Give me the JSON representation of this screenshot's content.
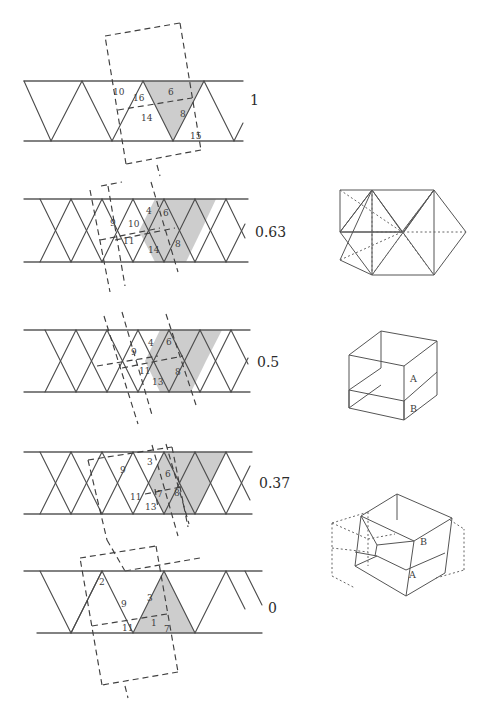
{
  "figure": {
    "background_color": "#ffffff",
    "shade_color": "#c4c4c4",
    "line_color": "#4a4a4a",
    "dash_color": "#3f3f3f"
  },
  "panels": [
    {
      "id": "panel-1",
      "value": "1",
      "strip_type": "alternating-triangles",
      "shaded_shape": "downward-triangle",
      "region_labels": [
        "10",
        "16",
        "6",
        "14",
        "8",
        "15"
      ],
      "labels": [
        {
          "text": "10",
          "x": 113,
          "y": 95
        },
        {
          "text": "16",
          "x": 133,
          "y": 101
        },
        {
          "text": "6",
          "x": 168,
          "y": 95
        },
        {
          "text": "14",
          "x": 141,
          "y": 121
        },
        {
          "text": "8",
          "x": 180,
          "y": 117
        },
        {
          "text": "15",
          "x": 190,
          "y": 139
        }
      ]
    },
    {
      "id": "panel-2",
      "value": "0.63",
      "strip_type": "zigzag-crossing",
      "shaded_shape": "hexagon",
      "region_labels": [
        "9",
        "10",
        "4",
        "6",
        "11",
        "14",
        "8"
      ],
      "labels": [
        {
          "text": "9",
          "x": 110,
          "y": 226
        },
        {
          "text": "10",
          "x": 128,
          "y": 227
        },
        {
          "text": "4",
          "x": 146,
          "y": 214
        },
        {
          "text": "6",
          "x": 163,
          "y": 216
        },
        {
          "text": "11",
          "x": 123,
          "y": 244
        },
        {
          "text": "14",
          "x": 148,
          "y": 253
        },
        {
          "text": "8",
          "x": 175,
          "y": 247
        }
      ]
    },
    {
      "id": "panel-3",
      "value": "0.5",
      "strip_type": "zigzag-crossing",
      "shaded_shape": "hexagon",
      "region_labels": [
        "9",
        "4",
        "6",
        "11",
        "13",
        "8"
      ],
      "labels": [
        {
          "text": "9",
          "x": 131,
          "y": 355
        },
        {
          "text": "4",
          "x": 148,
          "y": 346
        },
        {
          "text": "6",
          "x": 166,
          "y": 345
        },
        {
          "text": "11",
          "x": 139,
          "y": 374
        },
        {
          "text": "13",
          "x": 152,
          "y": 385
        },
        {
          "text": "8",
          "x": 175,
          "y": 375
        }
      ]
    },
    {
      "id": "panel-4",
      "value": "0.37",
      "strip_type": "zigzag-crossing",
      "shaded_shape": "hexagon",
      "region_labels": [
        "9",
        "3",
        "6",
        "11",
        "7",
        "8",
        "13"
      ],
      "labels": [
        {
          "text": "9",
          "x": 120,
          "y": 473
        },
        {
          "text": "3",
          "x": 147,
          "y": 465
        },
        {
          "text": "6",
          "x": 165,
          "y": 477
        },
        {
          "text": "11",
          "x": 130,
          "y": 500
        },
        {
          "text": "7",
          "x": 157,
          "y": 497
        },
        {
          "text": "8",
          "x": 174,
          "y": 496
        },
        {
          "text": "13",
          "x": 145,
          "y": 510
        }
      ]
    },
    {
      "id": "panel-5",
      "value": "0",
      "strip_type": "upward-triangles",
      "shaded_shape": "upward-triangle",
      "region_labels": [
        "2",
        "9",
        "3",
        "11",
        "1",
        "7"
      ],
      "labels": [
        {
          "text": "2",
          "x": 99,
          "y": 585
        },
        {
          "text": "9",
          "x": 121,
          "y": 607
        },
        {
          "text": "3",
          "x": 147,
          "y": 601
        },
        {
          "text": "11",
          "x": 122,
          "y": 631
        },
        {
          "text": "1",
          "x": 151,
          "y": 626
        },
        {
          "text": "7",
          "x": 164,
          "y": 632
        }
      ]
    }
  ],
  "solids": [
    {
      "id": "solid-top",
      "name": "flattened-rhombohedron",
      "face_labels": []
    },
    {
      "id": "solid-middle",
      "name": "cube",
      "face_labels": [
        {
          "text": "A",
          "x": 410,
          "y": 382
        },
        {
          "text": "B",
          "x": 410,
          "y": 412
        }
      ]
    },
    {
      "id": "solid-bottom",
      "name": "sheared-rhombohedron",
      "face_labels": [
        {
          "text": "B",
          "x": 420,
          "y": 545
        },
        {
          "text": "A",
          "x": 409,
          "y": 578
        }
      ]
    }
  ]
}
